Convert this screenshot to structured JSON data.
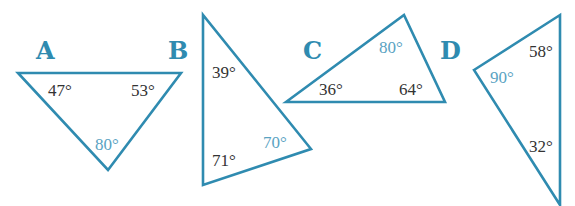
{
  "colors": {
    "stroke": "#2f8bb0",
    "letter": "#2f8bb0",
    "angle_text": "#333333",
    "highlight_angle": "#5aa3c2"
  },
  "triangles": [
    {
      "label": "A",
      "points": "18,73 181,73 108,170",
      "angles": [
        {
          "value": "47°",
          "x": 48,
          "y": 96,
          "highlight": false
        },
        {
          "value": "53°",
          "x": 131,
          "y": 96,
          "highlight": false
        },
        {
          "value": "80°",
          "x": 95,
          "y": 150,
          "highlight": true
        }
      ],
      "label_pos": {
        "x": 36,
        "y": 59
      }
    },
    {
      "label": "B",
      "points": "203,15 203,185 311,149",
      "angles": [
        {
          "value": "39°",
          "x": 212,
          "y": 78,
          "highlight": false
        },
        {
          "value": "71°",
          "x": 212,
          "y": 166,
          "highlight": false
        },
        {
          "value": "70°",
          "x": 263,
          "y": 148,
          "highlight": true
        }
      ],
      "label_pos": {
        "x": 168,
        "y": 59
      }
    },
    {
      "label": "C",
      "points": "286,102 404,15 445,102",
      "angles": [
        {
          "value": "36°",
          "x": 319,
          "y": 95,
          "highlight": false
        },
        {
          "value": "80°",
          "x": 379,
          "y": 53,
          "highlight": true
        },
        {
          "value": "64°",
          "x": 399,
          "y": 95,
          "highlight": false
        }
      ],
      "label_pos": {
        "x": 303,
        "y": 59
      }
    },
    {
      "label": "D",
      "points": "474,70 560,15 560,205",
      "angles": [
        {
          "value": "90°",
          "x": 490,
          "y": 83,
          "highlight": true
        },
        {
          "value": "58°",
          "x": 529,
          "y": 57,
          "highlight": false
        },
        {
          "value": "32°",
          "x": 529,
          "y": 152,
          "highlight": false
        }
      ],
      "label_pos": {
        "x": 440,
        "y": 59
      }
    }
  ]
}
